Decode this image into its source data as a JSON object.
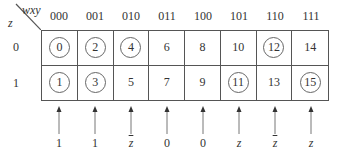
{
  "corner": {
    "col_var_label": "wxy",
    "row_var_label": "z"
  },
  "column_headers": [
    "000",
    "001",
    "010",
    "011",
    "100",
    "101",
    "110",
    "111"
  ],
  "row_headers": [
    "0",
    "1"
  ],
  "cells": [
    [
      {
        "value": "0",
        "circled": true
      },
      {
        "value": "2",
        "circled": true
      },
      {
        "value": "4",
        "circled": true
      },
      {
        "value": "6",
        "circled": false
      },
      {
        "value": "8",
        "circled": false
      },
      {
        "value": "10",
        "circled": false
      },
      {
        "value": "12",
        "circled": true
      },
      {
        "value": "14",
        "circled": false
      }
    ],
    [
      {
        "value": "1",
        "circled": true
      },
      {
        "value": "3",
        "circled": true
      },
      {
        "value": "5",
        "circled": false
      },
      {
        "value": "7",
        "circled": false
      },
      {
        "value": "9",
        "circled": false
      },
      {
        "value": "11",
        "circled": true
      },
      {
        "value": "13",
        "circled": false
      },
      {
        "value": "15",
        "circled": true
      }
    ]
  ],
  "column_functions": [
    {
      "text": "1",
      "italic": false,
      "overline": false
    },
    {
      "text": "1",
      "italic": false,
      "overline": false
    },
    {
      "text": "z",
      "italic": true,
      "overline": true
    },
    {
      "text": "0",
      "italic": false,
      "overline": false
    },
    {
      "text": "0",
      "italic": false,
      "overline": false
    },
    {
      "text": "z",
      "italic": true,
      "overline": false
    },
    {
      "text": "z",
      "italic": true,
      "overline": true
    },
    {
      "text": "z",
      "italic": true,
      "overline": false
    }
  ],
  "colors": {
    "line": "#555555",
    "text": "#333333",
    "background": "#ffffff"
  }
}
